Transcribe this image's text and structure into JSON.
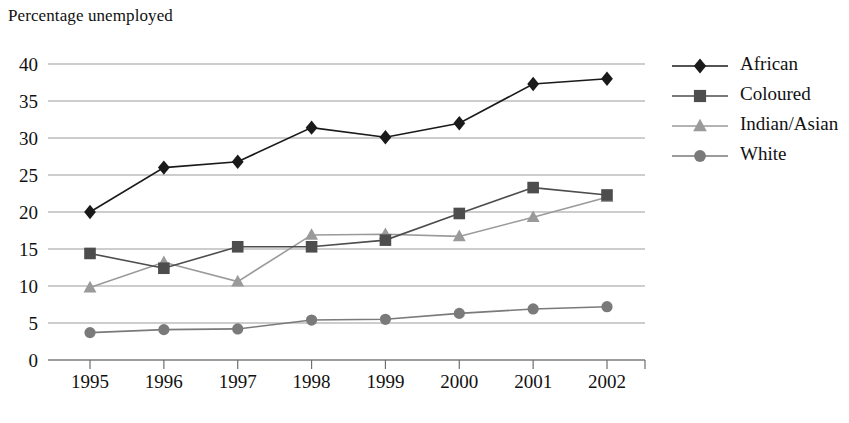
{
  "chart_data": {
    "type": "line",
    "title": "Percentage unemployed",
    "xlabel": "",
    "ylabel": "",
    "categories": [
      "1995",
      "1996",
      "1997",
      "1998",
      "1999",
      "2000",
      "2001",
      "2002"
    ],
    "x": [
      1995,
      1996,
      1997,
      1998,
      1999,
      2000,
      2001,
      2002
    ],
    "ylim": [
      0,
      40
    ],
    "yticks": [
      0,
      5,
      10,
      15,
      20,
      25,
      30,
      35,
      40
    ],
    "ytick_labels": [
      "0",
      "5",
      "10",
      "15",
      "20",
      "25",
      "30",
      "35",
      "40"
    ],
    "grid": true,
    "grid_axis": "y",
    "legend_position": "right",
    "series": [
      {
        "name": "African",
        "marker": "diamond",
        "color": "#1a1a1a",
        "values": [
          20.0,
          26.0,
          26.8,
          31.4,
          30.1,
          32.0,
          37.3,
          38.0
        ]
      },
      {
        "name": "Coloured",
        "marker": "square",
        "color": "#4d4d4d",
        "values": [
          14.4,
          12.4,
          15.3,
          15.3,
          16.2,
          19.8,
          23.3,
          22.3
        ]
      },
      {
        "name": "Indian/Asian",
        "marker": "triangle",
        "color": "#9a9a9a",
        "values": [
          9.8,
          13.2,
          10.6,
          16.9,
          17.0,
          16.7,
          19.3,
          22.0
        ]
      },
      {
        "name": "White",
        "marker": "circle",
        "color": "#7a7a7a",
        "values": [
          3.7,
          4.1,
          4.2,
          5.4,
          5.5,
          6.3,
          6.9,
          7.2
        ]
      }
    ]
  },
  "legend": {
    "entries": [
      "African",
      "Coloured",
      "Indian/Asian",
      "White"
    ]
  }
}
